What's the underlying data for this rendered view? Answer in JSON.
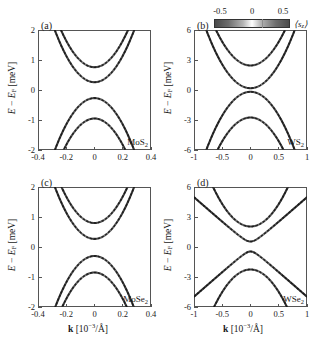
{
  "figure": {
    "axis_labels": {
      "ylabel_main": "E",
      "ylabel_minus": " − ",
      "ylabel_ef": "E",
      "ylabel_ef_sub": "F",
      "ylabel_unit": " [meV]",
      "xlabel_k": "k",
      "xlabel_unit_open": " [10",
      "xlabel_exp": "−3",
      "xlabel_unit_close": "/Å]"
    },
    "colorbar": {
      "name": "sz-colorbar",
      "title_open": "⟨s",
      "title_sub": "z",
      "title_close": "⟩",
      "ticks": [
        "-0.5",
        "0",
        "0.5"
      ],
      "tick_values": [
        -0.5,
        0,
        0.5
      ],
      "low_color": "#4a4a4a",
      "mid_color": "#ffffff",
      "high_color": "#4a4a4a",
      "orientation": "horizontal"
    }
  },
  "chart_data": [
    {
      "panel": "a",
      "tag": "(a)",
      "type": "line",
      "title": "MoS2",
      "material_main": "MoS",
      "material_sub": "2",
      "xlabel": "k [10^-3/Å]",
      "ylabel": "E − E_F [meV]",
      "xlim": [
        -0.4,
        0.4
      ],
      "ylim": [
        -2,
        2
      ],
      "xticks": [
        -0.4,
        -0.2,
        0,
        0.2,
        0.4
      ],
      "xticklabels": [
        "-0.4",
        "-0.2",
        "0",
        "0.2",
        "0.4"
      ],
      "yticks": [
        2,
        1,
        0,
        -1,
        -2
      ],
      "yticklabels": [
        "2",
        "1",
        "0",
        "-1",
        "-2"
      ],
      "grid": false,
      "legend": "none",
      "series": [
        {
          "name": "conduction-outer",
          "vertex_k": 0.0,
          "vertex_E": 0.76,
          "curvature": 22.0,
          "branch": "up"
        },
        {
          "name": "conduction-inner",
          "vertex_k": 0.0,
          "vertex_E": 0.26,
          "curvature": 22.0,
          "branch": "up"
        },
        {
          "name": "valence-inner",
          "vertex_k": 0.0,
          "vertex_E": -0.27,
          "curvature": 22.0,
          "branch": "down"
        },
        {
          "name": "valence-outer",
          "vertex_k": 0.0,
          "vertex_E": -0.95,
          "curvature": 22.0,
          "branch": "down"
        }
      ]
    },
    {
      "panel": "b",
      "tag": "(b)",
      "type": "line",
      "title": "WS2",
      "material_main": "WS",
      "material_sub": "2",
      "xlabel": "k [10^-3/Å]",
      "ylabel": "E − E_F [meV]",
      "xlim": [
        -1,
        1
      ],
      "ylim": [
        -6,
        6
      ],
      "xticks": [
        -1,
        -0.5,
        0,
        0.5,
        1
      ],
      "xticklabels": [
        "-1",
        "-0.5",
        "0",
        "0.5",
        "1"
      ],
      "yticks": [
        6,
        3,
        0,
        -3,
        -6
      ],
      "yticklabels": [
        "6",
        "3",
        "0",
        "-3",
        "-6"
      ],
      "grid": false,
      "legend": "none",
      "series": [
        {
          "name": "conduction-outer",
          "vertex_k": 0.0,
          "vertex_E": 2.45,
          "curvature": 9.5,
          "branch": "up"
        },
        {
          "name": "conduction-inner",
          "vertex_k": 0.0,
          "vertex_E": 0.18,
          "curvature": 9.5,
          "branch": "up"
        },
        {
          "name": "valence-inner",
          "vertex_k": 0.0,
          "vertex_E": -0.18,
          "curvature": 9.5,
          "branch": "down"
        },
        {
          "name": "valence-outer",
          "vertex_k": 0.0,
          "vertex_E": -2.75,
          "curvature": 9.5,
          "branch": "down"
        }
      ]
    },
    {
      "panel": "c",
      "tag": "(c)",
      "type": "line",
      "title": "MoSe2",
      "material_main": "MoSe",
      "material_sub": "2",
      "xlabel": "k [10^-3/Å]",
      "ylabel": "E − E_F [meV]",
      "xlim": [
        -0.4,
        0.4
      ],
      "ylim": [
        -2,
        2
      ],
      "xticks": [
        -0.4,
        -0.2,
        0,
        0.2,
        0.4
      ],
      "xticklabels": [
        "-0.4",
        "-0.2",
        "0",
        "0.2",
        "0.4"
      ],
      "yticks": [
        2,
        1,
        0,
        -1,
        -2
      ],
      "yticklabels": [
        "2",
        "1",
        "0",
        "-1",
        "-2"
      ],
      "grid": false,
      "legend": "none",
      "series": [
        {
          "name": "conduction-outer",
          "vertex_k": 0.0,
          "vertex_E": 0.8,
          "curvature": 22.0,
          "branch": "up"
        },
        {
          "name": "conduction-inner",
          "vertex_k": 0.0,
          "vertex_E": 0.27,
          "curvature": 22.0,
          "branch": "up"
        },
        {
          "name": "valence-inner",
          "vertex_k": 0.0,
          "vertex_E": -0.3,
          "curvature": 22.0,
          "branch": "down"
        },
        {
          "name": "valence-outer",
          "vertex_k": 0.0,
          "vertex_E": -0.85,
          "curvature": 22.0,
          "branch": "down"
        }
      ]
    },
    {
      "panel": "d",
      "tag": "(d)",
      "type": "line",
      "title": "WSe2",
      "material_main": "WSe",
      "material_sub": "2",
      "xlabel": "k [10^-3/Å]",
      "ylabel": "E − E_F [meV]",
      "xlim": [
        -1,
        1
      ],
      "ylim": [
        -6,
        6
      ],
      "xticks": [
        -1,
        -0.5,
        0,
        0.5,
        1
      ],
      "xticklabels": [
        "-1",
        "-0.5",
        "0",
        "0.5",
        "1"
      ],
      "yticks": [
        6,
        3,
        0,
        -3,
        -6
      ],
      "yticklabels": [
        "6",
        "3",
        "0",
        "-3",
        "-6"
      ],
      "grid": false,
      "legend": "none",
      "series": [
        {
          "name": "conduction-outer",
          "vertex_k": 0.0,
          "vertex_E": 2.05,
          "curvature": 9.0,
          "branch": "up"
        },
        {
          "name": "conduction-inner",
          "vertex_k": 0.0,
          "vertex_E": 0.55,
          "curvature": 9.0,
          "branch": "up",
          "anticross": true
        },
        {
          "name": "valence-inner",
          "vertex_k": 0.0,
          "vertex_E": -0.45,
          "curvature": 9.0,
          "branch": "down",
          "anticross": true
        },
        {
          "name": "valence-outer",
          "vertex_k": 0.0,
          "vertex_E": -2.25,
          "curvature": 9.0,
          "branch": "down"
        }
      ]
    }
  ]
}
